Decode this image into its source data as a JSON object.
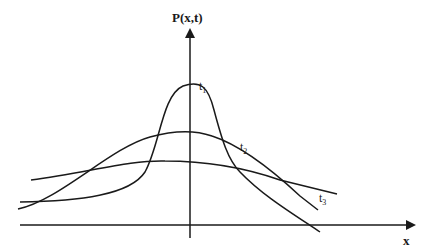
{
  "diagram": {
    "type": "probability-density-spreading",
    "y_axis_label": "P(x,t)",
    "x_axis_label": "x",
    "curves": [
      {
        "id": "t1",
        "label": "t",
        "subscript": "1",
        "description": "tallest, narrowest peak"
      },
      {
        "id": "t2",
        "label": "t",
        "subscript": "2",
        "description": "medium height and width"
      },
      {
        "id": "t3",
        "label": "t",
        "subscript": "3",
        "description": "flattest, widest"
      }
    ],
    "colors": {
      "stroke": "#1a1a1a",
      "background": "#ffffff"
    }
  }
}
